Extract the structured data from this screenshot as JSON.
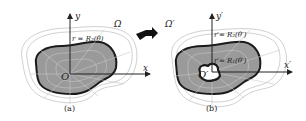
{
  "panel_a": {
    "caption": "(a)",
    "region_label": "Ω",
    "origin_label": "O",
    "x_axis_label": "x",
    "y_axis_label": "y",
    "boundary_label": "r = R₂(θ)"
  },
  "panel_b": {
    "caption": "(b)",
    "region_label": "Ω′",
    "origin_label": "O′",
    "x_axis_label": "x′",
    "y_axis_label": "y′",
    "outer_boundary_label": "r′= R₂(θ′)",
    "inner_boundary_label": "r′= R₁(θ′)"
  },
  "arrow": "transform-arrow",
  "colors": {
    "fill": "#9a9a9a",
    "boundary": "#1a1a1a",
    "grid": "#b8b8b8"
  }
}
